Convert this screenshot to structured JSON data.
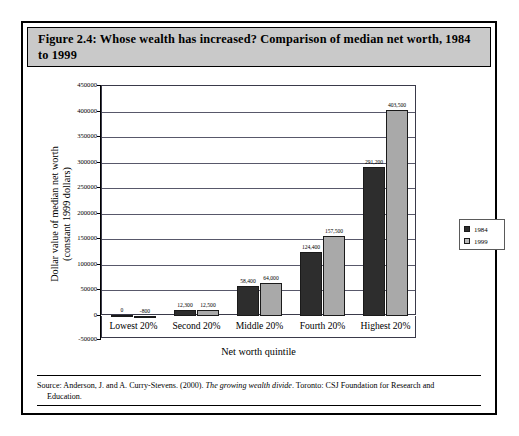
{
  "figure": {
    "title": "Figure 2.4: Whose wealth has increased? Comparison of median net worth, 1984 to 1999",
    "source_prefix": "Source: Anderson, J. and A. Curry-Stevens. (2000). ",
    "source_italic": "The growing wealth divide",
    "source_suffix": ". Toronto: CSJ Foundation for Research and",
    "source_line2": "Education."
  },
  "legend": {
    "entries": [
      {
        "label": "1984",
        "color": "#2d2d2d"
      },
      {
        "label": "1999",
        "color": "#b9b9b9"
      }
    ]
  },
  "chart_data": {
    "type": "bar",
    "title": "Figure 2.4: Whose wealth has increased? Comparison of median net worth, 1984 to 1999",
    "xlabel": "Net worth quintile",
    "ylabel": "Dollar value of median net worth (constant 1999 dollars)",
    "ylabel_line1": "Dollar value of median net worth",
    "ylabel_line2": "(constant 1999 dollars)",
    "categories": [
      "Lowest 20%",
      "Second 20%",
      "Middle 20%",
      "Fourth 20%",
      "Highest 20%"
    ],
    "series": [
      {
        "name": "1984",
        "color": "#2d2d2d",
        "values": [
          0,
          12300,
          58400,
          124400,
          291200
        ],
        "labels": [
          "0",
          "12,300",
          "58,400",
          "124,400",
          "291,200"
        ]
      },
      {
        "name": "1999",
        "color": "#a9a9a9",
        "values": [
          -800,
          12500,
          64000,
          157500,
          403500
        ],
        "labels": [
          "-800",
          "12,500",
          "64,000",
          "157,500",
          "403,500"
        ]
      }
    ],
    "ylim": [
      -50000,
      450000
    ],
    "ytick_interval": 50000,
    "yticks": [
      450000,
      400000,
      350000,
      300000,
      250000,
      200000,
      150000,
      100000,
      50000,
      0,
      -50000
    ],
    "ytick_labels": [
      "450000",
      "400000",
      "350000",
      "300000",
      "250000",
      "200000",
      "150000",
      "100000",
      "50000",
      "0",
      "-50000"
    ],
    "grid": true,
    "legend_position": "right"
  }
}
